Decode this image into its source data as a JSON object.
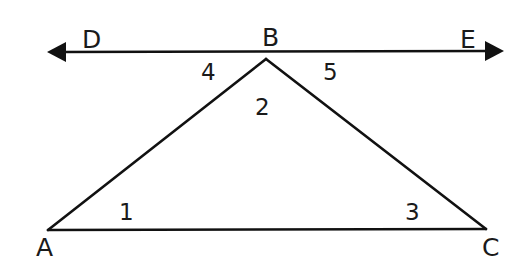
{
  "diagram": {
    "type": "geometry",
    "stroke_color": "#111111",
    "line": {
      "name": "DE",
      "left_endpoint": "D",
      "right_endpoint": "E",
      "arrows": "both"
    },
    "points": {
      "A": "A",
      "B": "B",
      "C": "C",
      "D": "D",
      "E": "E"
    },
    "angles": {
      "a1": "1",
      "a2": "2",
      "a3": "3",
      "a4": "4",
      "a5": "5"
    },
    "triangle": {
      "vertices": [
        "A",
        "B",
        "C"
      ]
    }
  }
}
